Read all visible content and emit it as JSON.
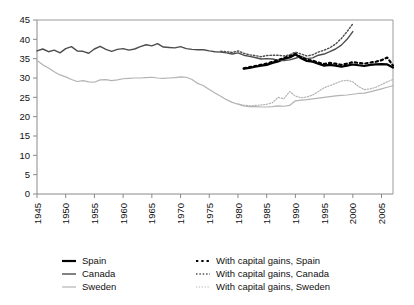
{
  "chart_data": {
    "type": "line",
    "title": "",
    "subtitle": "",
    "xlabel": "",
    "ylabel": "",
    "xlim": [
      1945,
      2007
    ],
    "ylim": [
      0,
      45
    ],
    "y_ticks": [
      0,
      5,
      10,
      15,
      20,
      25,
      30,
      35,
      40,
      45
    ],
    "x_ticks": [
      1945,
      1950,
      1955,
      1960,
      1965,
      1970,
      1975,
      1980,
      1985,
      1990,
      1995,
      2000,
      2005
    ],
    "grid": false,
    "legend_position": "bottom",
    "colors": {
      "spain": "#000000",
      "canada": "#4d4d4d",
      "sweden": "#b3b3b3"
    },
    "series": [
      {
        "name": "Spain",
        "style": "solid",
        "color": "#000000",
        "x": [
          1981,
          1982,
          1983,
          1984,
          1985,
          1986,
          1987,
          1988,
          1989,
          1990,
          1991,
          1992,
          1993,
          1994,
          1995,
          1996,
          1997,
          1998,
          1999,
          2000,
          2001,
          2002,
          2003,
          2004,
          2005,
          2006,
          2007
        ],
        "values": [
          32.4,
          32.6,
          32.9,
          33.2,
          33.4,
          33.9,
          34.3,
          34.9,
          35.3,
          36.1,
          35.1,
          34.4,
          34.2,
          33.7,
          33.2,
          33.4,
          33.2,
          32.9,
          33.2,
          33.5,
          33.3,
          33.1,
          33.4,
          33.5,
          33.6,
          33.5,
          32.7
        ]
      },
      {
        "name": "Canada",
        "style": "solid",
        "color": "#4d4d4d",
        "x": [
          1945,
          1946,
          1947,
          1948,
          1949,
          1950,
          1951,
          1952,
          1953,
          1954,
          1955,
          1956,
          1957,
          1958,
          1959,
          1960,
          1961,
          1962,
          1963,
          1964,
          1965,
          1966,
          1967,
          1968,
          1969,
          1970,
          1971,
          1972,
          1973,
          1974,
          1975,
          1976,
          1977,
          1978,
          1979,
          1980,
          1981,
          1982,
          1983,
          1984,
          1985,
          1986,
          1987,
          1988,
          1989,
          1990,
          1991,
          1992,
          1993,
          1994,
          1995,
          1996,
          1997,
          1998,
          1999,
          2000
        ],
        "values": [
          37.0,
          37.5,
          36.8,
          37.2,
          36.5,
          37.6,
          38.1,
          37.0,
          36.9,
          36.4,
          37.5,
          38.2,
          37.4,
          36.9,
          37.4,
          37.6,
          37.2,
          37.5,
          38.1,
          38.6,
          38.3,
          38.9,
          38.0,
          37.9,
          37.8,
          38.1,
          37.6,
          37.4,
          37.3,
          37.3,
          37.0,
          36.8,
          36.7,
          36.5,
          36.2,
          36.5,
          35.9,
          35.6,
          35.3,
          34.9,
          35.0,
          34.9,
          34.6,
          34.5,
          34.7,
          35.1,
          35.6,
          35.0,
          35.2,
          35.9,
          36.2,
          36.8,
          37.5,
          38.5,
          40.0,
          42.0
        ]
      },
      {
        "name": "Sweden",
        "style": "solid",
        "color": "#b3b3b3",
        "x": [
          1945,
          1946,
          1947,
          1948,
          1949,
          1950,
          1951,
          1952,
          1953,
          1954,
          1955,
          1956,
          1957,
          1958,
          1959,
          1960,
          1961,
          1962,
          1963,
          1964,
          1965,
          1966,
          1967,
          1968,
          1969,
          1970,
          1971,
          1972,
          1973,
          1974,
          1975,
          1976,
          1977,
          1978,
          1979,
          1980,
          1981,
          1982,
          1983,
          1984,
          1985,
          1986,
          1987,
          1988,
          1989,
          1990,
          1991,
          1992,
          1993,
          1994,
          1995,
          1996,
          1997,
          1998,
          1999,
          2000,
          2001,
          2002,
          2003,
          2004,
          2005,
          2006,
          2007
        ],
        "values": [
          34.5,
          33.4,
          32.6,
          31.6,
          30.8,
          30.3,
          29.6,
          29.1,
          29.3,
          29.0,
          28.9,
          29.5,
          29.6,
          29.3,
          29.5,
          29.8,
          29.9,
          30.0,
          30.0,
          30.1,
          30.2,
          30.0,
          29.9,
          30.0,
          30.1,
          30.3,
          30.2,
          29.6,
          28.6,
          28.0,
          27.0,
          26.1,
          25.3,
          24.4,
          23.7,
          23.2,
          22.8,
          22.6,
          22.6,
          22.5,
          22.5,
          22.6,
          22.8,
          22.7,
          22.9,
          24.1,
          24.3,
          24.4,
          24.6,
          24.8,
          25.0,
          25.2,
          25.4,
          25.5,
          25.6,
          25.8,
          26.0,
          26.1,
          26.4,
          26.8,
          27.2,
          27.6,
          28.0
        ]
      },
      {
        "name": "With capital gains, Spain",
        "style": "dotted",
        "color": "#000000",
        "x": [
          1981,
          1982,
          1983,
          1984,
          1985,
          1986,
          1987,
          1988,
          1989,
          1990,
          1991,
          1992,
          1993,
          1994,
          1995,
          1996,
          1997,
          1998,
          1999,
          2000,
          2001,
          2002,
          2003,
          2004,
          2005,
          2006,
          2007
        ],
        "values": [
          32.5,
          32.8,
          33.1,
          33.4,
          33.7,
          34.2,
          34.6,
          35.2,
          35.7,
          36.3,
          35.3,
          34.7,
          34.5,
          34.0,
          33.6,
          33.9,
          33.7,
          33.4,
          33.7,
          34.1,
          33.9,
          33.7,
          34.0,
          34.2,
          34.6,
          35.3,
          33.2
        ]
      },
      {
        "name": "With capital gains, Canada",
        "style": "dotted",
        "color": "#4d4d4d",
        "x": [
          1977,
          1978,
          1979,
          1980,
          1981,
          1982,
          1983,
          1984,
          1985,
          1986,
          1987,
          1988,
          1989,
          1990,
          1991,
          1992,
          1993,
          1994,
          1995,
          1996,
          1997,
          1998,
          1999,
          2000
        ],
        "values": [
          36.9,
          36.8,
          36.6,
          37.0,
          36.4,
          36.0,
          35.8,
          35.5,
          35.8,
          35.9,
          35.9,
          35.7,
          36.0,
          36.7,
          36.2,
          35.7,
          36.0,
          36.7,
          37.2,
          37.8,
          38.8,
          40.2,
          42.0,
          44.0
        ]
      },
      {
        "name": "With capital gains, Sweden",
        "style": "dotted",
        "color": "#b3b3b3",
        "x": [
          1980,
          1981,
          1982,
          1983,
          1984,
          1985,
          1986,
          1987,
          1988,
          1989,
          1990,
          1991,
          1992,
          1993,
          1994,
          1995,
          1996,
          1997,
          1998,
          1999,
          2000,
          2001,
          2002,
          2003,
          2004,
          2005,
          2006,
          2007
        ],
        "values": [
          23.3,
          23.0,
          22.8,
          22.9,
          23.0,
          23.2,
          23.6,
          25.0,
          24.6,
          26.5,
          25.3,
          24.9,
          25.1,
          25.6,
          26.5,
          27.5,
          28.0,
          28.6,
          29.2,
          29.4,
          29.0,
          27.8,
          27.0,
          27.2,
          27.6,
          28.3,
          29.0,
          29.6
        ]
      }
    ]
  },
  "legend": {
    "column_left": [
      {
        "label": "Spain",
        "style": "solid",
        "color": "#000000",
        "width": 2.2
      },
      {
        "label": "Canada",
        "style": "solid",
        "color": "#4d4d4d",
        "width": 1.4
      },
      {
        "label": "Sweden",
        "style": "solid",
        "color": "#b3b3b3",
        "width": 1.2
      }
    ],
    "column_right": [
      {
        "label": "With capital gains, Spain",
        "style": "dotted",
        "color": "#000000",
        "width": 2.2
      },
      {
        "label": "With capital gains, Canada",
        "style": "dotted",
        "color": "#4d4d4d",
        "width": 1.4
      },
      {
        "label": "With capital gains, Sweden",
        "style": "dotted",
        "color": "#b3b3b3",
        "width": 1.2
      }
    ]
  }
}
